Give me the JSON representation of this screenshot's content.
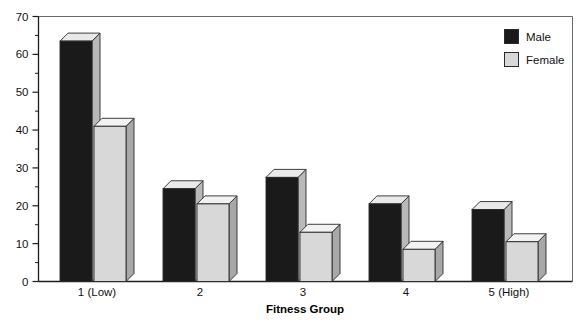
{
  "chart_data": {
    "type": "bar",
    "title": "",
    "subtitle": "",
    "xlabel": "Fitness Group",
    "ylabel": "",
    "categories": [
      "1 (Low)",
      "2",
      "3",
      "4",
      "5 (High)"
    ],
    "series": [
      {
        "name": "Male",
        "values": [
          63.5,
          24.5,
          27.5,
          20.5,
          19.0
        ],
        "color": "#1a1a1a"
      },
      {
        "name": "Female",
        "values": [
          41.0,
          20.5,
          13.0,
          8.5,
          10.5
        ],
        "color": "#d8d8d8"
      }
    ],
    "ylim": [
      0,
      70
    ],
    "ytick_labels": [
      "0",
      "10",
      "20",
      "30",
      "40",
      "50",
      "60",
      "70"
    ],
    "ytick_values": [
      0,
      10,
      20,
      30,
      40,
      50,
      60,
      70
    ],
    "yminor_values": [
      5,
      15,
      25,
      35,
      45,
      55,
      65
    ],
    "grid": false,
    "style": "3d-bars",
    "legend_position": "top-right",
    "legend": [
      {
        "label": "Male",
        "swatch": "#1a1a1a"
      },
      {
        "label": "Female",
        "swatch": "#d8d8d8"
      }
    ]
  },
  "colors": {
    "background": "#ffffff",
    "frame": "#6a6a6a",
    "axis": "#1d1d1d",
    "text": "#111111",
    "male_front": "#1a1a1a",
    "male_top": "#e9e9e9",
    "male_side": "#b9b9b9",
    "female_front": "#d8d8d8",
    "female_top": "#f2f2f2",
    "female_side": "#a8a8a8",
    "bar_outline": "#2a2a2a"
  }
}
